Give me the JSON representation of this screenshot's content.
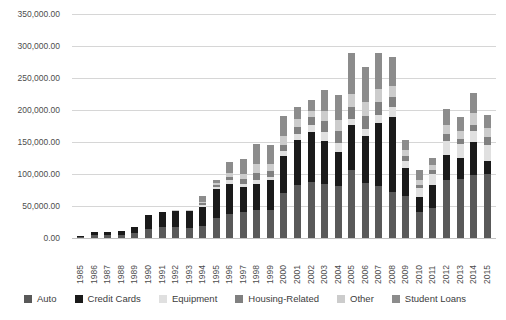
{
  "chart_data": {
    "type": "bar",
    "subtype": "stacked-vertical",
    "title": "",
    "subtitle": "",
    "xlabel": "",
    "ylabel": "",
    "ylim": [
      0,
      350000
    ],
    "ytick_step": 50000,
    "ytick_labels": [
      "0.00",
      "50,000.00",
      "100,000.00",
      "150,000.00",
      "200,000.00",
      "250,000.00",
      "300,000.00",
      "350,000.00"
    ],
    "ytick_values": [
      0,
      50000,
      100000,
      150000,
      200000,
      250000,
      300000,
      350000
    ],
    "grid": true,
    "grid_axis": "y",
    "legend_position": "bottom",
    "categories": [
      "1985",
      "1986",
      "1987",
      "1988",
      "1989",
      "1990",
      "1991",
      "1992",
      "1993",
      "1994",
      "1995",
      "1996",
      "1997",
      "1998",
      "1999",
      "2000",
      "2001",
      "2002",
      "2003",
      "2004",
      "2005",
      "2006",
      "2007",
      "2008",
      "2009",
      "2010",
      "2011",
      "2012",
      "2013",
      "2014",
      "2015"
    ],
    "series": [
      {
        "name": "Auto",
        "color": "#595959",
        "values": [
          1000,
          4000,
          4000,
          5000,
          8000,
          14000,
          17000,
          17000,
          16000,
          19000,
          31000,
          38000,
          41000,
          43000,
          44000,
          70000,
          83000,
          87000,
          85000,
          81000,
          107000,
          86000,
          81000,
          72000,
          65000,
          41000,
          47000,
          90000,
          92000,
          99000,
          100000
        ]
      },
      {
        "name": "Credit Cards",
        "color": "#1a1a1a",
        "values": [
          1000,
          5000,
          5000,
          6000,
          9000,
          22000,
          23000,
          25000,
          26000,
          30000,
          45000,
          47000,
          39000,
          41000,
          46000,
          58000,
          70000,
          78000,
          67000,
          54000,
          70000,
          73000,
          99000,
          117000,
          45000,
          23000,
          36000,
          40000,
          33000,
          51000,
          21000
        ]
      },
      {
        "name": "Equipment",
        "color": "#e0e0e0",
        "values": [
          0,
          0,
          0,
          0,
          0,
          0,
          0,
          0,
          0,
          2000,
          3000,
          5000,
          5000,
          6000,
          6000,
          8000,
          9000,
          11000,
          14000,
          13000,
          9000,
          12000,
          13000,
          15000,
          11000,
          14000,
          17000,
          22000,
          22000,
          18000,
          25000
        ]
      },
      {
        "name": "Housing-Related",
        "color": "#808080",
        "values": [
          0,
          0,
          0,
          0,
          0,
          0,
          0,
          0,
          0,
          3000,
          4000,
          6000,
          8000,
          11000,
          9000,
          10000,
          12000,
          13000,
          17000,
          19000,
          19000,
          20000,
          19000,
          16000,
          7000,
          5000,
          6000,
          10000,
          8000,
          9000,
          12000
        ]
      },
      {
        "name": "Other",
        "color": "#cccccc",
        "values": [
          0,
          0,
          0,
          0,
          0,
          0,
          1000,
          1000,
          1000,
          2000,
          3000,
          5000,
          7000,
          15000,
          11000,
          14000,
          12000,
          10000,
          15000,
          18000,
          20000,
          22000,
          21000,
          17000,
          9000,
          8000,
          8000,
          14000,
          12000,
          18000,
          14000
        ]
      },
      {
        "name": "Student Loans",
        "color": "#8c8c8c",
        "values": [
          0,
          0,
          0,
          0,
          0,
          0,
          0,
          0,
          0,
          9000,
          4000,
          18000,
          23000,
          31000,
          29000,
          30000,
          19000,
          17000,
          33000,
          38000,
          64000,
          55000,
          56000,
          46000,
          16000,
          16000,
          11000,
          26000,
          22000,
          31000,
          21000
        ]
      }
    ],
    "totals": [
      2000,
      9000,
      9000,
      11000,
      17000,
      36000,
      41000,
      43000,
      43000,
      65000,
      90000,
      119000,
      123000,
      147000,
      145000,
      190000,
      205000,
      216000,
      231000,
      223000,
      289000,
      268000,
      289000,
      283000,
      153000,
      107000,
      125000,
      202000,
      189000,
      226000,
      193000
    ]
  },
  "legend": {
    "items": [
      {
        "label": "Auto",
        "swatch_name": "legend-swatch-auto"
      },
      {
        "label": "Credit Cards",
        "swatch_name": "legend-swatch-credit-cards"
      },
      {
        "label": "Equipment",
        "swatch_name": "legend-swatch-equipment"
      },
      {
        "label": "Housing-Related",
        "swatch_name": "legend-swatch-housing-related"
      },
      {
        "label": "Other",
        "swatch_name": "legend-swatch-other"
      },
      {
        "label": "Student Loans",
        "swatch_name": "legend-swatch-student-loans"
      }
    ]
  },
  "style": {
    "background": "#ffffff",
    "gridline_color": "#d6d6d6",
    "axis_text_color": "#4d4d4d",
    "legend_text_color": "#3d3d3d"
  }
}
